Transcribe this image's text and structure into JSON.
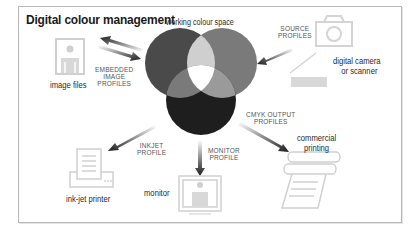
{
  "title": "Digital colour management",
  "center": {
    "label": "working colour space",
    "circles": [
      {
        "name": "red",
        "color": "#4a4a4a"
      },
      {
        "name": "green",
        "color": "#7a7a7a"
      },
      {
        "name": "blue",
        "color": "#1e1e1e"
      }
    ]
  },
  "devices": {
    "image_files": "image files",
    "camera": "digital camera",
    "camera_line2": "or scanner",
    "inkjet": "ink-jet printer",
    "monitor": "monitor",
    "commercial": "commercial",
    "commercial_line2": "printing"
  },
  "profiles": {
    "embedded": [
      "EMBEDDED",
      "IMAGE",
      "PROFILES"
    ],
    "source": [
      "SOURCE",
      "PROFILES"
    ],
    "inkjet": [
      "INKJET",
      "PROFILE"
    ],
    "monitor": [
      "MONITOR",
      "PROFILE"
    ],
    "cmyk": [
      "CMYK OUTPUT",
      "PROFILES"
    ]
  },
  "colors": {
    "icon_stroke": "#d0d0d0",
    "arrow": "#1a1a1a",
    "frame": "#b8b8b8"
  }
}
